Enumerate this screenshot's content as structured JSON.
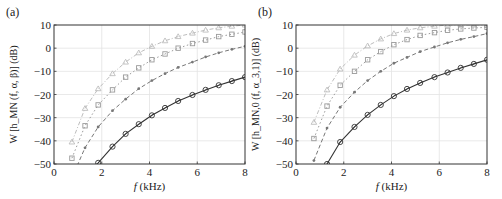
{
  "chart_data": [
    {
      "panel": "(a)",
      "type": "line",
      "xlabel": "f (kHz)",
      "ylabel": "W [h_MN (f, α, β)] (dB)",
      "xlim": [
        0,
        8
      ],
      "ylim": [
        -50,
        10
      ],
      "xticks": [
        0,
        2,
        4,
        6,
        8
      ],
      "yticks": [
        10,
        0,
        -10,
        -20,
        -30,
        -40,
        -50
      ],
      "grid": true,
      "x": [
        0.75,
        1.3,
        1.85,
        2.45,
        3.0,
        3.55,
        4.1,
        4.65,
        5.2,
        5.8,
        6.35,
        6.9,
        7.45,
        8.0
      ],
      "series": [
        {
          "name": "triangle",
          "marker": "triangle",
          "style": "dash-dot",
          "color": "#bdbdbd",
          "values": [
            -40.5,
            -26,
            -17.5,
            -11,
            -6,
            -2,
            0.8,
            3.2,
            5,
            6.5,
            7.8,
            8.8,
            9.5,
            10
          ]
        },
        {
          "name": "square",
          "marker": "square",
          "style": "dotted",
          "color": "#9a9a9a",
          "values": [
            -47.5,
            -33.5,
            -24.5,
            -18,
            -12.5,
            -8.5,
            -5,
            -2.5,
            0,
            2,
            3.5,
            5,
            6,
            7
          ]
        },
        {
          "name": "star",
          "marker": "asterisk",
          "style": "dashed",
          "color": "#777777",
          "values": [
            -56,
            -43,
            -34,
            -27,
            -22,
            -17.5,
            -14,
            -11,
            -8.3,
            -6,
            -3.8,
            -2,
            -0.5,
            0.8
          ]
        },
        {
          "name": "circle",
          "marker": "circle",
          "style": "solid",
          "color": "#333333",
          "values": [
            -62,
            -55,
            -49.5,
            -42.5,
            -37,
            -32.8,
            -29,
            -25.8,
            -22.8,
            -20.2,
            -18,
            -16,
            -14.2,
            -12.5
          ]
        }
      ]
    },
    {
      "panel": "(b)",
      "type": "line",
      "xlabel": "f (kHz)",
      "ylabel": "W [h_MN,0 (f, α_3,1)] (dB)",
      "xlim": [
        0,
        8
      ],
      "ylim": [
        -50,
        10
      ],
      "xticks": [
        0,
        2,
        4,
        6,
        8
      ],
      "yticks": [
        10,
        0,
        -10,
        -20,
        -30,
        -40,
        -50
      ],
      "grid": true,
      "x": [
        0.75,
        1.3,
        1.85,
        2.45,
        3.0,
        3.55,
        4.1,
        4.65,
        5.2,
        5.8,
        6.35,
        6.9,
        7.45,
        8.0
      ],
      "series": [
        {
          "name": "triangle",
          "marker": "triangle",
          "style": "dash-dot",
          "color": "#bdbdbd",
          "values": [
            -32,
            -18,
            -9,
            -3,
            1,
            4,
            6.3,
            7.8,
            8.8,
            9.5,
            10,
            10,
            10,
            10
          ]
        },
        {
          "name": "square",
          "marker": "square",
          "style": "dotted",
          "color": "#9a9a9a",
          "values": [
            -39,
            -25,
            -16,
            -10,
            -5,
            -1.5,
            1.5,
            3.7,
            5.5,
            6.7,
            7.7,
            8.3,
            8.7,
            9
          ]
        },
        {
          "name": "star",
          "marker": "asterisk",
          "style": "dashed",
          "color": "#777777",
          "values": [
            -48.5,
            -34.5,
            -25.5,
            -19,
            -14,
            -10,
            -6.5,
            -4,
            -1.5,
            0.5,
            2.3,
            3.8,
            5,
            6.3
          ]
        },
        {
          "name": "circle",
          "marker": "circle",
          "style": "solid",
          "color": "#333333",
          "values": [
            -60,
            -50,
            -40.5,
            -34,
            -28.8,
            -24.5,
            -20.7,
            -17.6,
            -15,
            -12.5,
            -10.5,
            -8.5,
            -6.8,
            -5
          ]
        }
      ]
    }
  ],
  "panels": [
    {
      "label": "(a)",
      "xlabel_italic": "f",
      "xlabel_unit": "(kHz)",
      "ylabel": "W [h_MN (f, α, β)] (dB)"
    },
    {
      "label": "(b)",
      "xlabel_italic": "f",
      "xlabel_unit": "(kHz)",
      "ylabel": "W [h_MN,0 (f, α_3,1)] (dB)"
    }
  ]
}
